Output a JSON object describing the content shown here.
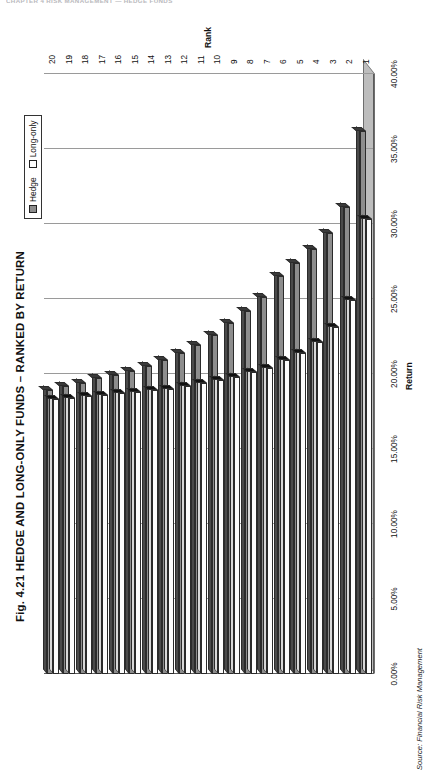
{
  "page": {
    "running_head": "CHAPTER 4    RISK MANAGEMENT — HEDGE FUNDS",
    "source_note": "Source: Financial Risk Management"
  },
  "legend": {
    "items": [
      {
        "label": "Hedge",
        "swatch": "hedge-swatch"
      },
      {
        "label": "Long-only",
        "swatch": "long-only-swatch"
      }
    ]
  },
  "colors": {
    "hedge_face": "#8d8d8d",
    "hedge_top": "#4a4a4a",
    "long_only_face": "#fdfdfd",
    "long_only_top": "#d8d8d8",
    "gridline": "#9a9a9a",
    "axis": "#5a5a5a",
    "floor": "#bdbdbd"
  },
  "chart_data": {
    "type": "bar",
    "title": "Fig. 4.21  HEDGE AND LONG-ONLY FUNDS – RANKED BY RETURN",
    "orientation": "horizontal",
    "xlabel": "Rank",
    "ylabel": "Return",
    "grid": true,
    "legend_position": "top-right",
    "ylim": [
      0,
      40
    ],
    "yticks": [
      "0.00%",
      "5.00%",
      "10.00%",
      "15.00%",
      "20.00%",
      "25.00%",
      "30.00%",
      "35.00%",
      "40.00%"
    ],
    "ytick_values": [
      0,
      5,
      10,
      15,
      20,
      25,
      30,
      35,
      40
    ],
    "categories": [
      "1",
      "2",
      "3",
      "4",
      "5",
      "6",
      "7",
      "8",
      "9",
      "10",
      "11",
      "12",
      "13",
      "14",
      "15",
      "16",
      "17",
      "18",
      "19",
      "20"
    ],
    "series": [
      {
        "name": "Hedge",
        "values": [
          36.2,
          31.1,
          29.4,
          28.3,
          27.4,
          26.5,
          25.1,
          24.2,
          23.4,
          22.6,
          21.9,
          21.4,
          20.9,
          20.5,
          20.2,
          19.9,
          19.7,
          19.4,
          19.2,
          18.9
        ]
      },
      {
        "name": "Long-only",
        "values": [
          30.3,
          24.9,
          23.1,
          22.1,
          21.4,
          20.9,
          20.4,
          20.1,
          19.8,
          19.6,
          19.4,
          19.2,
          19.0,
          18.9,
          18.8,
          18.7,
          18.6,
          18.5,
          18.4,
          18.3
        ]
      }
    ]
  }
}
